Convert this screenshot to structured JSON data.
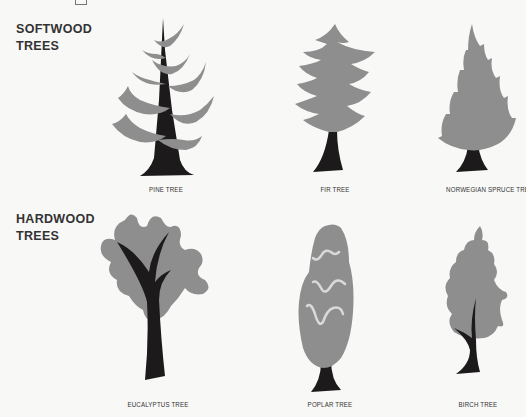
{
  "colors": {
    "background": "#f8f8f7",
    "foliage": "#8e8e8e",
    "trunk": "#1d1a1c",
    "poplar_streak": "#d9d9d9",
    "text": "#333333"
  },
  "sections": [
    {
      "title_line1": "SOFTWOOD",
      "title_line2": "TREES",
      "trees": [
        {
          "label": "PINE TREE",
          "icon": "pine-tree-icon"
        },
        {
          "label": "FIR TREE",
          "icon": "fir-tree-icon"
        },
        {
          "label": "NORWEGIAN SPRUCE TREE",
          "icon": "spruce-tree-icon"
        }
      ]
    },
    {
      "title_line1": "HARDWOOD",
      "title_line2": "TREES",
      "trees": [
        {
          "label": "EUCALYPTUS TREE",
          "icon": "eucalyptus-tree-icon"
        },
        {
          "label": "POPLAR TREE",
          "icon": "poplar-tree-icon"
        },
        {
          "label": "BIRCH TREE",
          "icon": "birch-tree-icon"
        }
      ]
    }
  ]
}
